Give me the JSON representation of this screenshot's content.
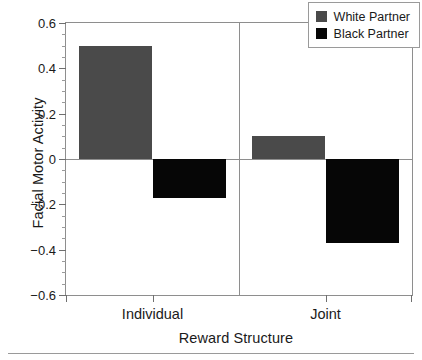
{
  "chart_data": {
    "type": "bar",
    "title": "",
    "xlabel": "Reward Structure",
    "ylabel": "Facial Motor Activity",
    "categories": [
      "Individual",
      "Joint"
    ],
    "series": [
      {
        "name": "White Partner",
        "color": "#4a4a4a",
        "values": [
          0.5,
          0.1
        ]
      },
      {
        "name": "Black Partner",
        "color": "#060606",
        "values": [
          -0.17,
          -0.37
        ]
      }
    ],
    "ylim": [
      -0.6,
      0.6
    ],
    "ytick_labels": [
      "0.6",
      "0.4",
      "0.2",
      "0",
      "−0.2",
      "−0.4",
      "−0.6"
    ],
    "ytick_values": [
      0.6,
      0.4,
      0.2,
      0,
      -0.2,
      -0.4,
      -0.6
    ],
    "yminor_step": 0.05,
    "grid": false,
    "zero_line": true,
    "group_divider": true,
    "legend_position": "top-right",
    "legend_entries": [
      "White Partner",
      "Black Partner"
    ]
  }
}
